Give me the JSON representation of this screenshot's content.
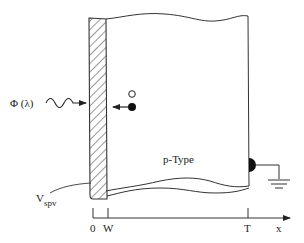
{
  "diagram": {
    "type": "surface-photovoltage-schematic",
    "labels": {
      "illumination": "Φ (λ)",
      "surface_voltage_main": "V",
      "surface_voltage_sub": "spv",
      "material": "p-Type",
      "axis_origin": "0",
      "axis_depletion": "W",
      "axis_thickness": "T",
      "axis_variable": "x"
    },
    "components": {
      "surface_layer": "hatched depletion/surface region (0 to W)",
      "bulk": "p-Type semiconductor block",
      "carriers": [
        "hole (open circle)",
        "electron (filled dot) moving toward surface"
      ],
      "back_contact": "ohmic contact at x = T",
      "ground": "ground symbol"
    },
    "colors": {
      "line": "#333333",
      "background": "#ffffff",
      "fill_dark": "#111111"
    }
  }
}
